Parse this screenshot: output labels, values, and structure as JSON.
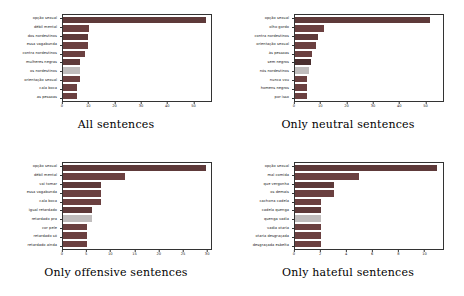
{
  "figure": {
    "background": "#ffffff",
    "width": 464,
    "height": 296
  },
  "palette": {
    "dark": "#5e3a3a",
    "mid": "#6b4040",
    "light": "#c0bdbd",
    "axis": "#333333",
    "text": "#1a1a1a"
  },
  "chart_data": [
    {
      "type": "bar",
      "orientation": "horizontal",
      "title": "All sentences",
      "xlabel": "",
      "ylabel": "",
      "xlim": [
        0,
        57
      ],
      "xticks": [
        0,
        10,
        20,
        30,
        40,
        50
      ],
      "grid": false,
      "legend": "none",
      "categories": [
        "opção sexual",
        "débil mental",
        "dos nordestinos",
        "essa vagabunda",
        "contra nordestinos",
        "mulheres negras",
        "os nordestinos",
        "orientação sexual",
        "cala boca",
        "as pessoas"
      ],
      "values": [
        55,
        10,
        9.5,
        9.5,
        8.5,
        6.5,
        6.5,
        6.5,
        5.5,
        5.5
      ],
      "bar_colors": [
        "#5e3a3a",
        "#6b4040",
        "#5e3a3a",
        "#6b4040",
        "#6b4040",
        "#5e3a3a",
        "#c0bdbd",
        "#6b4040",
        "#6b4040",
        "#6b4040"
      ]
    },
    {
      "type": "bar",
      "orientation": "horizontal",
      "title": "Only neutral sentences",
      "xlabel": "",
      "ylabel": "",
      "xlim": [
        0,
        57
      ],
      "xticks": [
        0,
        10,
        20,
        30,
        40,
        50
      ],
      "grid": false,
      "legend": "none",
      "categories": [
        "opção sexual",
        "olho gordo",
        "contra nordestinos",
        "orientação sexual",
        "às pessoas",
        "sem negros",
        "nós nordestinos",
        "nunca vou",
        "homens negros",
        "por isso"
      ],
      "values": [
        52,
        11,
        9,
        8,
        6.5,
        6,
        5.5,
        4.5,
        4.5,
        4.5
      ],
      "bar_colors": [
        "#5e3a3a",
        "#6b4040",
        "#5e3a3a",
        "#6b4040",
        "#6b4040",
        "#4a2f2f",
        "#c0bdbd",
        "#6b4040",
        "#6b4040",
        "#6b4040"
      ]
    },
    {
      "type": "bar",
      "orientation": "horizontal",
      "title": "Only offensive sentences",
      "xlabel": "",
      "ylabel": "",
      "xlim": [
        0,
        31
      ],
      "xticks": [
        0,
        5,
        10,
        15,
        20,
        25,
        30
      ],
      "grid": false,
      "legend": "none",
      "categories": [
        "opção sexual",
        "débil mental",
        "vai tomar",
        "essa vagabunda",
        "cala boca",
        "igual retardado",
        "retardado pra",
        "cor pele",
        "retardado só",
        "retardado ainda"
      ],
      "values": [
        30,
        13,
        8,
        8,
        8,
        6,
        6,
        5,
        5,
        5
      ],
      "bar_colors": [
        "#5e3a3a",
        "#6b4040",
        "#5e3a3a",
        "#6b4040",
        "#6b4040",
        "#5e3a3a",
        "#c0bdbd",
        "#6b4040",
        "#6b4040",
        "#6b4040"
      ]
    },
    {
      "type": "bar",
      "orientation": "horizontal",
      "title": "Only hateful sentences",
      "xlabel": "",
      "ylabel": "",
      "xlim": [
        0,
        11.5
      ],
      "xticks": [
        0,
        2,
        4,
        6,
        8,
        10
      ],
      "grid": false,
      "legend": "none",
      "categories": [
        "opção sexual",
        "mal comida",
        "que vergonha",
        "os demais",
        "cachorra cadela",
        "cadela quenga",
        "quenga vadia",
        "vadia otaria",
        "otaria desgraçada",
        "desgraçada esbelta"
      ],
      "values": [
        11,
        5,
        3,
        3,
        2,
        2,
        2,
        2,
        2,
        2
      ],
      "bar_colors": [
        "#5e3a3a",
        "#6b4040",
        "#5e3a3a",
        "#6b4040",
        "#6b4040",
        "#5e3a3a",
        "#c0bdbd",
        "#6b4040",
        "#6b4040",
        "#6b4040"
      ]
    }
  ]
}
